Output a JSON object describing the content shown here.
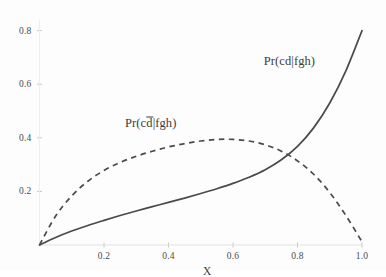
{
  "chart_data": {
    "type": "line",
    "title": "",
    "xlabel": "X",
    "ylabel": "",
    "xlim": [
      0.0,
      1.0
    ],
    "ylim": [
      0.0,
      0.84
    ],
    "grid": false,
    "legend_position": "inline-annotations",
    "xticks": [
      "0.2",
      "0.4",
      "0.6",
      "0.8",
      "1.0"
    ],
    "xtick_values": [
      0.2,
      0.4,
      0.6,
      0.8,
      1.0
    ],
    "yticks": [
      "0.2",
      "0.4",
      "0.6",
      "0.8"
    ],
    "ytick_values": [
      0.2,
      0.4,
      0.6,
      0.8
    ],
    "x": [
      0.0,
      0.05,
      0.1,
      0.15,
      0.2,
      0.25,
      0.3,
      0.35,
      0.4,
      0.45,
      0.5,
      0.55,
      0.6,
      0.65,
      0.7,
      0.75,
      0.8,
      0.85,
      0.9,
      0.95,
      1.0
    ],
    "series": [
      {
        "name": "Pr(cd|fgh)",
        "style": "solid",
        "color": "#4a4a4a",
        "label_x": 0.775,
        "label_y": 0.685,
        "values": [
          0.0,
          0.028,
          0.052,
          0.073,
          0.092,
          0.11,
          0.127,
          0.143,
          0.159,
          0.175,
          0.192,
          0.21,
          0.23,
          0.253,
          0.281,
          0.318,
          0.368,
          0.437,
          0.53,
          0.65,
          0.8
        ]
      },
      {
        "name": "Pr(cd̅|fgh)",
        "style": "dashed",
        "color": "#4a4a4a",
        "label_x": 0.345,
        "label_y": 0.455,
        "label_prefix": "Pr(c",
        "label_overbar": "d",
        "label_suffix": "|fgh)",
        "values": [
          0.0,
          0.108,
          0.183,
          0.238,
          0.278,
          0.308,
          0.331,
          0.35,
          0.366,
          0.378,
          0.388,
          0.394,
          0.394,
          0.388,
          0.374,
          0.35,
          0.314,
          0.264,
          0.196,
          0.11,
          0.012
        ]
      }
    ],
    "annotations": [
      {
        "name": "curve-crossing",
        "x": 0.745,
        "y": 0.335
      }
    ]
  },
  "axis": {
    "x_label": "X"
  }
}
